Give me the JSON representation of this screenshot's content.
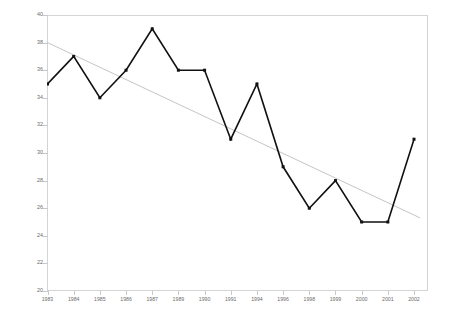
{
  "chart_data": {
    "type": "line",
    "title": "",
    "xlabel": "",
    "ylabel": "",
    "categories": [
      "1983",
      "1984",
      "1985",
      "1986",
      "1987",
      "1989",
      "1990",
      "1991",
      "1994",
      "1996",
      "1998",
      "1999",
      "2000",
      "2001",
      "2002"
    ],
    "values": [
      35,
      37,
      34,
      36,
      39,
      36,
      36,
      31,
      35,
      29,
      26,
      28,
      25,
      25,
      31
    ],
    "series": [
      {
        "name": "data",
        "values": [
          35,
          37,
          34,
          36,
          39,
          36,
          36,
          31,
          35,
          29,
          26,
          28,
          25,
          25,
          31
        ],
        "color": "#111111",
        "markers": "square"
      },
      {
        "name": "linear-trend",
        "endpoints": [
          38.0,
          25.3
        ],
        "color": "#bdbdbd",
        "style": "thin-line"
      }
    ],
    "ylim": [
      20,
      40
    ],
    "ytick_step": 2,
    "yticks": [
      20,
      22,
      24,
      26,
      28,
      30,
      32,
      34,
      36,
      38,
      40
    ],
    "grid": false,
    "legend": "none",
    "frame": "full-box",
    "axis_color": "#d4d4d4",
    "tick_label_color": "#6b6b6b"
  }
}
